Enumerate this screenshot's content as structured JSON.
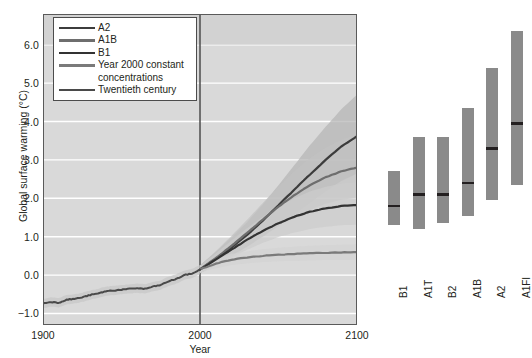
{
  "figure": {
    "background": "#ffffff",
    "plot_bg": "#d9d9d9",
    "grid_color": "#ffffff",
    "frame_color": "#5a5a5a"
  },
  "chart_data": {
    "type": "line",
    "title": "",
    "xlabel": "Year",
    "ylabel": "Global surface warming (°C)",
    "xlim": [
      1900,
      2100
    ],
    "ylim": [
      -1.3,
      6.8
    ],
    "yticks": [
      6.0,
      5.0,
      4.0,
      3.0,
      2.0,
      1.0,
      0.0,
      -1.0
    ],
    "ytick_labels": [
      "6.0",
      "5.0",
      "4.0",
      "3.0",
      "2.0",
      "1.0",
      "0.0",
      "−1.0"
    ],
    "xticks": [
      1900,
      2000,
      2100
    ],
    "xtick_labels": [
      "1900",
      "2000",
      "2100"
    ],
    "grid": true,
    "grid_axis": "y",
    "legend_position": "upper left",
    "divider_year": 2000,
    "series": [
      {
        "name": "A2",
        "color": "#3c3c3c",
        "band_color": "#b4b4b4",
        "width": 2.2,
        "x": [
          2000,
          2010,
          2020,
          2030,
          2040,
          2050,
          2060,
          2070,
          2080,
          2090,
          2100
        ],
        "values": [
          0.15,
          0.42,
          0.72,
          1.05,
          1.42,
          1.82,
          2.22,
          2.62,
          3.0,
          3.35,
          3.62
        ],
        "band_low": [
          0.05,
          0.26,
          0.5,
          0.74,
          1.0,
          1.28,
          1.58,
          1.88,
          2.18,
          2.45,
          2.65
        ],
        "band_high": [
          0.25,
          0.6,
          0.98,
          1.38,
          1.84,
          2.34,
          2.86,
          3.38,
          3.86,
          4.32,
          4.7
        ]
      },
      {
        "name": "A1B",
        "color": "#6e6e6e",
        "band_color": "#c2c2c2",
        "width": 2.2,
        "x": [
          2000,
          2010,
          2020,
          2030,
          2040,
          2050,
          2060,
          2070,
          2080,
          2090,
          2100
        ],
        "values": [
          0.15,
          0.44,
          0.76,
          1.1,
          1.45,
          1.78,
          2.08,
          2.34,
          2.55,
          2.7,
          2.8
        ],
        "band_low": [
          0.05,
          0.28,
          0.54,
          0.8,
          1.06,
          1.3,
          1.52,
          1.7,
          1.86,
          1.96,
          2.02
        ],
        "band_high": [
          0.25,
          0.62,
          1.02,
          1.44,
          1.88,
          2.3,
          2.7,
          3.04,
          3.32,
          3.52,
          3.66
        ]
      },
      {
        "name": "B1",
        "color": "#333333",
        "band_color": "#cccccc",
        "width": 2.2,
        "x": [
          2000,
          2010,
          2020,
          2030,
          2040,
          2050,
          2060,
          2070,
          2080,
          2090,
          2100
        ],
        "values": [
          0.15,
          0.4,
          0.66,
          0.92,
          1.15,
          1.35,
          1.52,
          1.65,
          1.74,
          1.8,
          1.82
        ],
        "band_low": [
          0.05,
          0.26,
          0.46,
          0.66,
          0.84,
          0.99,
          1.11,
          1.2,
          1.26,
          1.3,
          1.31
        ],
        "band_high": [
          0.25,
          0.56,
          0.9,
          1.22,
          1.52,
          1.78,
          2.0,
          2.18,
          2.3,
          2.38,
          2.42
        ]
      },
      {
        "name": "Year 2000 constant concentrations",
        "color": "#7a7a7a",
        "band_color": "#d2d2d2",
        "width": 2.2,
        "x": [
          2000,
          2010,
          2020,
          2030,
          2040,
          2050,
          2060,
          2070,
          2080,
          2090,
          2100
        ],
        "values": [
          0.15,
          0.3,
          0.4,
          0.46,
          0.5,
          0.53,
          0.55,
          0.57,
          0.58,
          0.59,
          0.6
        ],
        "band_low": [
          0.07,
          0.18,
          0.26,
          0.31,
          0.34,
          0.36,
          0.37,
          0.38,
          0.39,
          0.39,
          0.4
        ],
        "band_high": [
          0.23,
          0.42,
          0.55,
          0.62,
          0.67,
          0.71,
          0.74,
          0.76,
          0.78,
          0.79,
          0.8
        ]
      },
      {
        "name": "Twentieth century",
        "color": "#4a4a4a",
        "band_color": "#c6c6c6",
        "width": 2.0,
        "x": [
          1900,
          1905,
          1910,
          1915,
          1920,
          1925,
          1930,
          1935,
          1940,
          1945,
          1950,
          1955,
          1960,
          1965,
          1970,
          1975,
          1980,
          1985,
          1990,
          1995,
          2000
        ],
        "values": [
          -0.74,
          -0.7,
          -0.72,
          -0.64,
          -0.62,
          -0.58,
          -0.52,
          -0.48,
          -0.42,
          -0.4,
          -0.38,
          -0.36,
          -0.34,
          -0.36,
          -0.3,
          -0.26,
          -0.16,
          -0.1,
          0.0,
          0.04,
          0.14
        ],
        "band_low": [
          -0.86,
          -0.82,
          -0.84,
          -0.76,
          -0.74,
          -0.7,
          -0.64,
          -0.6,
          -0.54,
          -0.52,
          -0.5,
          -0.48,
          -0.46,
          -0.48,
          -0.42,
          -0.38,
          -0.28,
          -0.22,
          -0.12,
          -0.08,
          0.02
        ],
        "band_high": [
          -0.62,
          -0.58,
          -0.6,
          -0.52,
          -0.5,
          -0.46,
          -0.4,
          -0.36,
          -0.3,
          -0.28,
          -0.26,
          -0.24,
          -0.22,
          -0.24,
          -0.18,
          -0.14,
          -0.04,
          0.02,
          0.12,
          0.16,
          0.26
        ]
      }
    ],
    "legend_entries": [
      {
        "label": "A2",
        "color": "#3c3c3c"
      },
      {
        "label": "A1B",
        "color": "#6e6e6e"
      },
      {
        "label": "B1",
        "color": "#333333"
      },
      {
        "label": "Year 2000 constant",
        "color": "#7a7a7a"
      },
      {
        "label": "concentrations",
        "color": ""
      },
      {
        "label": "Twentieth century",
        "color": "#4a4a4a"
      }
    ]
  },
  "bar_panel": {
    "type": "bar",
    "description": "Projected global surface warming ranges at 2090-2099 relative to 1980-1999",
    "bar_color": "#8a8a8a",
    "best_estimate_color": "#231f20",
    "categories": [
      "B1",
      "A1T",
      "B2",
      "A1B",
      "A2",
      "A1FI"
    ],
    "bars": [
      {
        "label": "B1",
        "low": 1.3,
        "high": 2.7,
        "best": 1.8
      },
      {
        "label": "A1T",
        "low": 1.2,
        "high": 3.6,
        "best": 2.1
      },
      {
        "label": "B2",
        "low": 1.35,
        "high": 3.6,
        "best": 2.1
      },
      {
        "label": "A1B",
        "low": 1.55,
        "high": 4.35,
        "best": 2.4
      },
      {
        "label": "A2",
        "low": 1.95,
        "high": 5.4,
        "best": 3.3
      },
      {
        "label": "A1FI",
        "low": 2.35,
        "high": 6.35,
        "best": 3.95
      }
    ]
  },
  "legend": {
    "items": [
      "A2",
      "A1B",
      "B1",
      "Year 2000 constant",
      "concentrations",
      "Twentieth century"
    ]
  }
}
